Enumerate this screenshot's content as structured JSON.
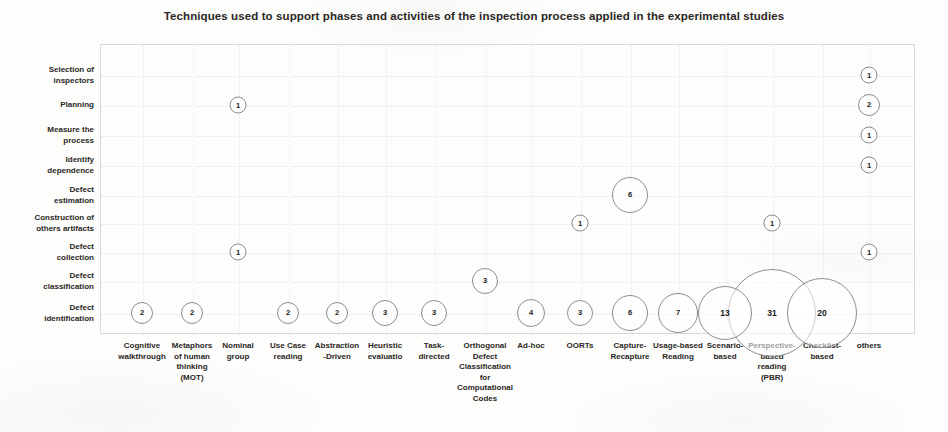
{
  "chart": {
    "title": "Techniques used to support phases and activities of the inspection process applied in the experimental studies"
  },
  "chart_data": {
    "type": "scatter",
    "title": "Techniques used to support phases and activities of the inspection process applied in the experimental studies",
    "xlabel": "",
    "ylabel": "",
    "grid": true,
    "legend": false,
    "note": "Bubble chart: marker area/size encodes the count shown inside each bubble.",
    "categories": [
      "Cognitive walkthrough",
      "Metaphors of human thinking (MOT)",
      "Nominal group",
      "Use Case reading",
      "Abstraction -Driven",
      "Heuristic evaluatio",
      "Task- directed",
      "Orthogonal Defect Classification for Computational Codes",
      "Ad-hoc",
      "OORTs",
      "Capture- Recapture",
      "Usage-based Reading",
      "Scenario- based",
      "Perspective- based reading (PBR)",
      "Checklist- based",
      "others"
    ],
    "x_tick_labels": [
      [
        "Cognitive",
        "walkthrough"
      ],
      [
        "Metaphors",
        "of human",
        "thinking",
        "(MOT)"
      ],
      [
        "Nominal",
        "group"
      ],
      [
        "Use Case",
        "reading"
      ],
      [
        "Abstraction",
        "-Driven"
      ],
      [
        "Heuristic",
        "evaluatio"
      ],
      [
        "Task-",
        "directed"
      ],
      [
        "Orthogonal",
        "Defect",
        "Classification",
        "for",
        "Computational",
        "Codes"
      ],
      [
        "Ad-hoc"
      ],
      [
        "OORTs"
      ],
      [
        "Capture-",
        "Recapture"
      ],
      [
        "Usage-based",
        "Reading"
      ],
      [
        "Scenario-",
        "based"
      ],
      [
        "Perspective-",
        "based",
        "reading",
        "(PBR)"
      ],
      [
        "Checklist-",
        "based"
      ],
      [
        "others"
      ]
    ],
    "y_categories": [
      "Selection of inspectors",
      "Planning",
      "Measure the process",
      "Identify dependence",
      "Defect estimation",
      "Construction of others artifacts",
      "Defect collection",
      "Defect classification",
      "Defect identification"
    ],
    "y_tick_labels": [
      [
        "Selection of",
        "inspectors"
      ],
      [
        "Planning"
      ],
      [
        "Measure the",
        "process"
      ],
      [
        "Identify",
        "dependence"
      ],
      [
        "Defect",
        "estimation"
      ],
      [
        "Construction of",
        "others artifacts"
      ],
      [
        "Defect",
        "collection"
      ],
      [
        "Defect",
        "classification"
      ],
      [
        "Defect",
        "identification"
      ]
    ],
    "points": [
      {
        "x": "others",
        "y": "Selection of inspectors",
        "value": 1
      },
      {
        "x": "Nominal group",
        "y": "Planning",
        "value": 1
      },
      {
        "x": "others",
        "y": "Planning",
        "value": 2
      },
      {
        "x": "others",
        "y": "Measure the process",
        "value": 1
      },
      {
        "x": "others",
        "y": "Identify dependence",
        "value": 1
      },
      {
        "x": "Capture- Recapture",
        "y": "Defect estimation",
        "value": 6
      },
      {
        "x": "OORTs",
        "y": "Construction of others artifacts",
        "value": 1
      },
      {
        "x": "Perspective- based reading (PBR)",
        "y": "Construction of others artifacts",
        "value": 1
      },
      {
        "x": "Nominal group",
        "y": "Defect collection",
        "value": 1
      },
      {
        "x": "others",
        "y": "Defect collection",
        "value": 1
      },
      {
        "x": "Orthogonal Defect Classification for Computational Codes",
        "y": "Defect classification",
        "value": 3
      },
      {
        "x": "Cognitive walkthrough",
        "y": "Defect identification",
        "value": 2
      },
      {
        "x": "Metaphors of human thinking (MOT)",
        "y": "Defect identification",
        "value": 2
      },
      {
        "x": "Use Case reading",
        "y": "Defect identification",
        "value": 2
      },
      {
        "x": "Abstraction -Driven",
        "y": "Defect identification",
        "value": 2
      },
      {
        "x": "Heuristic evaluatio",
        "y": "Defect identification",
        "value": 3
      },
      {
        "x": "Task- directed",
        "y": "Defect identification",
        "value": 3
      },
      {
        "x": "Ad-hoc",
        "y": "Defect identification",
        "value": 4
      },
      {
        "x": "OORTs",
        "y": "Defect identification",
        "value": 3
      },
      {
        "x": "Capture- Recapture",
        "y": "Defect identification",
        "value": 6
      },
      {
        "x": "Usage-based Reading",
        "y": "Defect identification",
        "value": 7
      },
      {
        "x": "Scenario- based",
        "y": "Defect identification",
        "value": 13
      },
      {
        "x": "Perspective- based reading (PBR)",
        "y": "Defect identification",
        "value": 31
      },
      {
        "x": "Checklist- based",
        "y": "Defect identification",
        "value": 20
      }
    ]
  },
  "layout": {
    "plot": {
      "left": 100,
      "top": 44,
      "width": 815,
      "height": 290
    },
    "x_centers": [
      142,
      192,
      238,
      288,
      337,
      385,
      434,
      485,
      531,
      580,
      630,
      678,
      725,
      772,
      822,
      869
    ],
    "y_centers": [
      75,
      105,
      135,
      165,
      195,
      223,
      252,
      281,
      313
    ],
    "bubble_radius": {
      "1": 8.5,
      "2": 11,
      "3": 13,
      "4": 14,
      "6": 18,
      "7": 20,
      "13": 27,
      "20": 35,
      "31": 44
    }
  },
  "colors": {
    "bubble_stroke": "#8d8d8d",
    "text": "#231f20",
    "frame": "#d9d9d9",
    "grid": "#e6e6e6",
    "background": "#fdfdfc"
  }
}
